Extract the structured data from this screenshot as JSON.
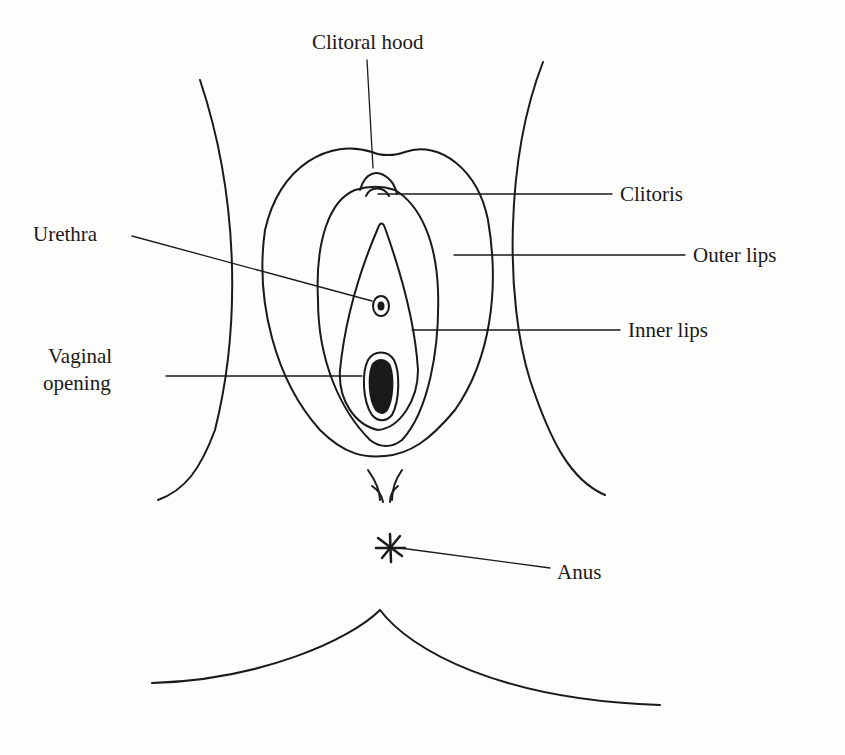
{
  "diagram": {
    "labels": {
      "clitoral_hood": "Clitoral hood",
      "clitoris": "Clitoris",
      "urethra": "Urethra",
      "outer_lips": "Outer lips",
      "inner_lips": "Inner lips",
      "vaginal_opening_1": "Vaginal",
      "vaginal_opening_2": "opening",
      "anus": "Anus"
    },
    "colors": {
      "line": "#1a1a1a",
      "background": "#fdfdfc"
    }
  }
}
